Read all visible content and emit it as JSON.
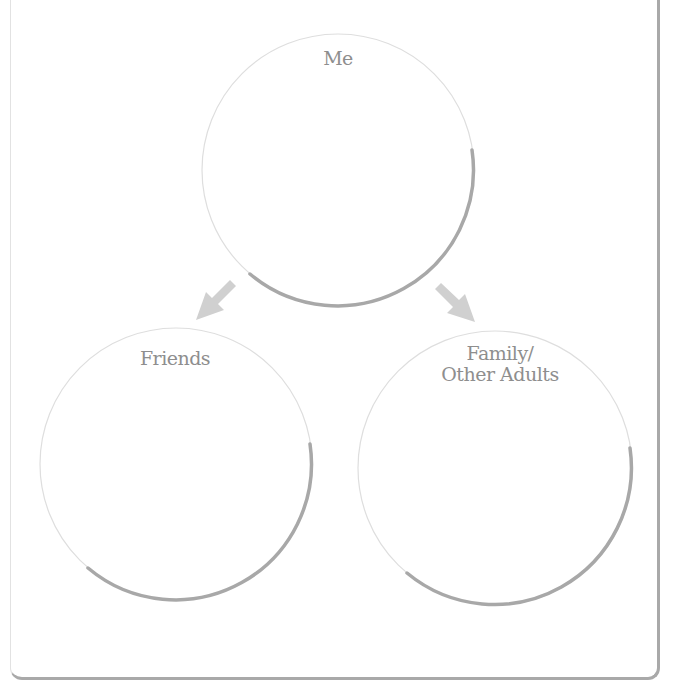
{
  "diagram": {
    "type": "three-circle relationship map",
    "colors": {
      "circle_outline_light": "#dcdcdc",
      "circle_shadow": "#a8a8a8",
      "arrow": "#cfcfcf",
      "label": "#8e8e8e",
      "frame": "#a9a9a9"
    },
    "nodes": [
      {
        "id": "me",
        "label": "Me",
        "cx": 338,
        "cy": 170,
        "r": 136
      },
      {
        "id": "friends",
        "label": "Friends",
        "cx": 176,
        "cy": 464,
        "r": 136
      },
      {
        "id": "family",
        "label_line1": "Family/",
        "label_line2": "Other Adults",
        "cx": 495,
        "cy": 468,
        "r": 137
      }
    ],
    "edges": [
      {
        "from": "me",
        "to": "friends",
        "direction": "down-left"
      },
      {
        "from": "me",
        "to": "family",
        "direction": "down-right"
      }
    ]
  }
}
